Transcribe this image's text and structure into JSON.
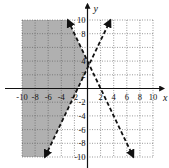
{
  "chart_data": {
    "type": "line",
    "title": "",
    "xlabel": "x",
    "ylabel": "y",
    "xlim": [
      -10,
      10
    ],
    "ylim": [
      -10,
      10
    ],
    "grid": true,
    "x_ticks": [
      "-10",
      "-8",
      "-6",
      "-4",
      "-2",
      "2",
      "4",
      "6",
      "8",
      "10"
    ],
    "y_ticks": [
      "10",
      "8",
      "4",
      "2",
      "-2",
      "-4",
      "-6",
      "-8",
      "-10"
    ],
    "series": [
      {
        "name": "boundary 1",
        "equation": "y = 2x + 3",
        "style": "dashed",
        "x": [
          -6.5,
          3.5
        ],
        "y": [
          -10,
          10
        ]
      },
      {
        "name": "boundary 2",
        "equation": "y = -2x + 4",
        "style": "dashed",
        "x": [
          -3,
          7
        ],
        "y": [
          10,
          -10
        ]
      }
    ],
    "shaded_region": "y > 2x + 3 and y < -2x + 4",
    "shade_color": "#b0b0b0"
  }
}
